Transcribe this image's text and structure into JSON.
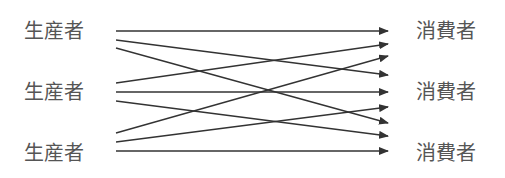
{
  "diagram": {
    "producers": [
      {
        "label": "生産者"
      },
      {
        "label": "生産者"
      },
      {
        "label": "生産者"
      }
    ],
    "consumers": [
      {
        "label": "消費者"
      },
      {
        "label": "消費者"
      },
      {
        "label": "消費者"
      }
    ],
    "colors": {
      "line": "#333333",
      "text": "#555555"
    },
    "edges": [
      {
        "from": 0,
        "to": 0
      },
      {
        "from": 0,
        "to": 1
      },
      {
        "from": 0,
        "to": 2
      },
      {
        "from": 1,
        "to": 0
      },
      {
        "from": 1,
        "to": 1
      },
      {
        "from": 1,
        "to": 2
      },
      {
        "from": 2,
        "to": 0
      },
      {
        "from": 2,
        "to": 1
      },
      {
        "from": 2,
        "to": 2
      }
    ]
  }
}
